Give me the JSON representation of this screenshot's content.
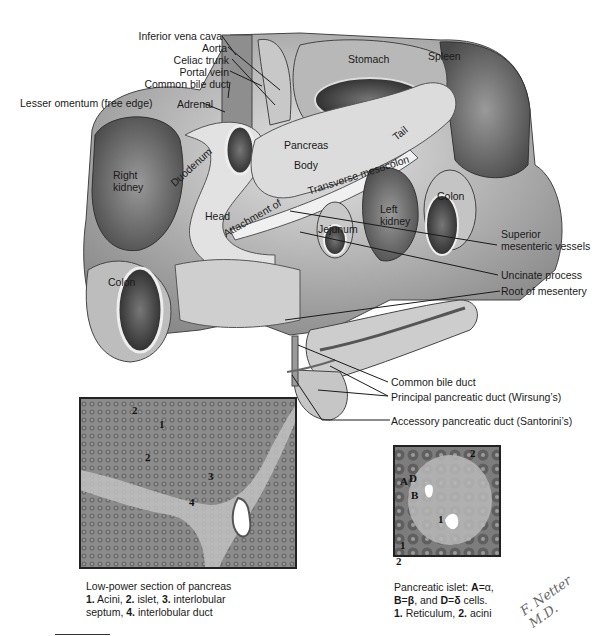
{
  "figure": {
    "type": "anatomical illustration"
  },
  "left_callouts": [
    {
      "id": "ivc",
      "label": "Inferior vena cava"
    },
    {
      "id": "aorta",
      "label": "Aorta"
    },
    {
      "id": "celiac",
      "label": "Celiac trunk"
    },
    {
      "id": "portal",
      "label": "Portal vein"
    },
    {
      "id": "cbd",
      "label": "Common bile duct"
    },
    {
      "id": "lesser_omentum",
      "label": "Lesser omentum (free edge)"
    }
  ],
  "organ_labels": {
    "adrenal": "Adrenal",
    "stomach": "Stomach",
    "spleen": "Spleen",
    "pancreas": "Pancreas",
    "body": "Body",
    "tail": "Tail",
    "right_kidney_1": "Right",
    "right_kidney_2": "kidney",
    "duodenum": "Duodenum",
    "transverse_mesocolon": "Transverse mesocolon",
    "head": "Head",
    "attachment": "Attachment of",
    "left_kidney_1": "Left",
    "left_kidney_2": "kidney",
    "colon_right": "Colon",
    "colon_left": "Colon",
    "jejunum": "Jejunum"
  },
  "right_callouts": [
    {
      "id": "smv_1",
      "label": "Superior"
    },
    {
      "id": "smv_2",
      "label": "mesenteric vessels"
    },
    {
      "id": "uncinate",
      "label": "Uncinate process"
    },
    {
      "id": "root_mesentery",
      "label": "Root of mesentery"
    },
    {
      "id": "cbd2",
      "label": "Common bile duct"
    },
    {
      "id": "wirsung",
      "label": "Principal pancreatic duct (Wirsung’s)"
    },
    {
      "id": "santorini",
      "label": "Accessory pancreatic duct (Santorini’s)"
    }
  ],
  "histology_low_power": {
    "markers": [
      "2",
      "1",
      "2",
      "3",
      "4"
    ],
    "caption_line1": "Low-power section of pancreas",
    "caption_parts": [
      {
        "b": "1.",
        "t": " Acini, "
      },
      {
        "b": "2.",
        "t": " islet, "
      },
      {
        "b": "3.",
        "t": " interlobular"
      }
    ],
    "caption_line3_parts": [
      {
        "t": "septum, "
      },
      {
        "b": "4.",
        "t": " interlobular duct"
      }
    ]
  },
  "histology_islet": {
    "markers": [
      "2",
      "A",
      "D",
      "B",
      "1",
      "1",
      "2"
    ],
    "caption_line1_text": "Pancreatic islet: ",
    "caption_line1_bold": "A",
    "caption_line1_eq": "=α,",
    "caption_line2": [
      {
        "b": "B",
        "t": "="
      },
      {
        "b": "β",
        "t": ", and "
      },
      {
        "b": "D",
        "t": "="
      },
      {
        "b": "δ",
        "t": " cells."
      }
    ],
    "caption_line3": [
      {
        "b": "1.",
        "t": " Reticulum, "
      },
      {
        "b": "2.",
        "t": " acini"
      }
    ]
  },
  "signature": "F. Netter M.D.",
  "colors": {
    "illustration_gray_dark": "#5a5a5a",
    "illustration_gray_mid": "#9a9a9a",
    "illustration_gray_light": "#d4d4d4",
    "histology_bg": "#8e8e8e",
    "leader_line": "#1a1a1a"
  }
}
